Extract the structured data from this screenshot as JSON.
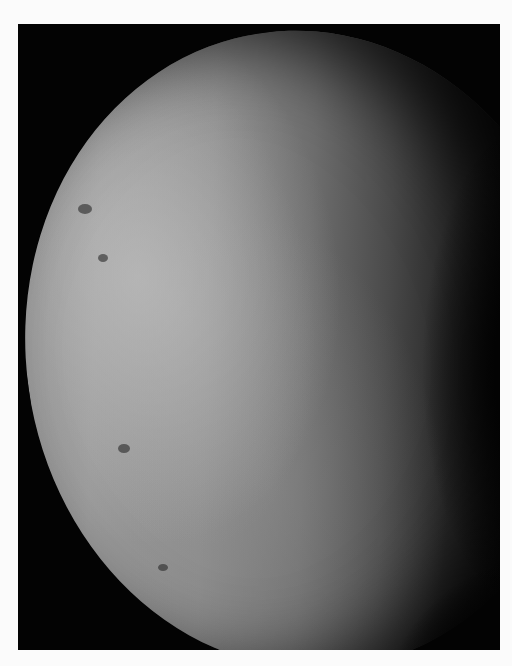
{
  "image": {
    "subject": "moon-like planetary body, crescent-gibbous phase",
    "description": "Grayscale photograph of a planetary moon lit from the left, with bright mottled terrain on the left limb and a dark terminator on the right, set against a black background",
    "colors": {
      "page_background": "#fbfbfb",
      "frame_background": "#030303",
      "surface_light": "#9a9a9a",
      "surface_mid": "#6e6e6e",
      "surface_dark": "#262626"
    }
  }
}
